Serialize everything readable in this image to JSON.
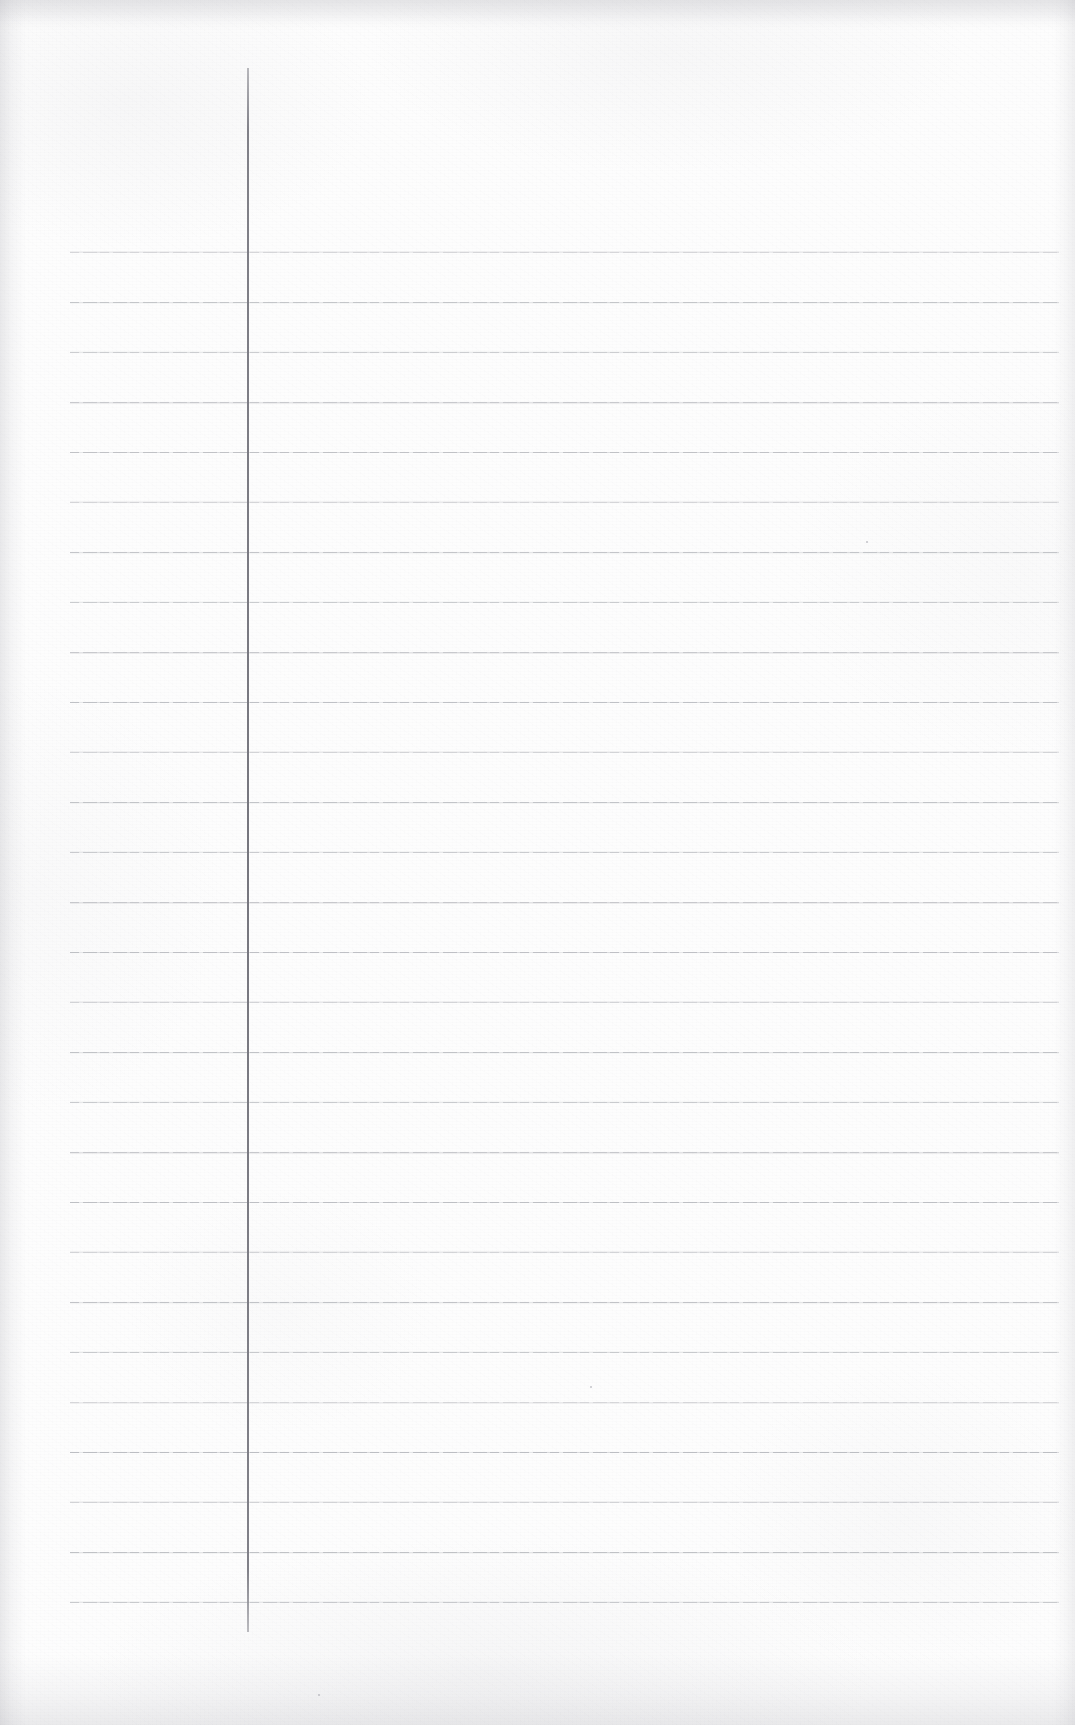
{
  "document": {
    "type": "scanned-ruled-notebook-page",
    "title": "Blank ruled notebook page",
    "orientation": "portrait",
    "page_width": 1075,
    "page_height": 1725,
    "has_text_content": false,
    "visible_text": "",
    "background_color": "#fdfdfd",
    "rule_line_color": "#b6b8bd",
    "margin_line_color": "#76767e",
    "edge_shadow_color": "#9e9ea6"
  },
  "ruling": {
    "rule_count": 28,
    "first_rule_y": 252,
    "rule_spacing": 50,
    "rule_left_x": 70,
    "rule_right_x": 1059,
    "rule_thickness": 1,
    "rule_ys": [
      252,
      302,
      352,
      402,
      452,
      502,
      552,
      602,
      652,
      702,
      752,
      802,
      852,
      902,
      952,
      1002,
      1052,
      1102,
      1152,
      1202,
      1252,
      1302,
      1352,
      1402,
      1452,
      1502,
      1552,
      1602
    ]
  },
  "margin_rule": {
    "x": 247,
    "top_y": 68,
    "bottom_y": 1632,
    "thickness": 2,
    "orientation": "vertical"
  },
  "specks": [
    {
      "x": 590,
      "y": 1386
    },
    {
      "x": 318,
      "y": 1694
    },
    {
      "x": 866,
      "y": 541
    }
  ]
}
